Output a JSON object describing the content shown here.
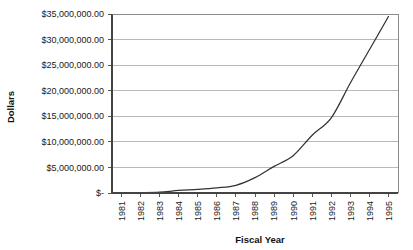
{
  "chart_data": {
    "type": "line",
    "title": "",
    "xlabel": "Fiscal Year",
    "ylabel": "Dollars",
    "grid": true,
    "legend": "none",
    "categories": [
      "1981",
      "1982",
      "1983",
      "1984",
      "1985",
      "1986",
      "1987",
      "1988",
      "1989",
      "1990",
      "1991",
      "1992",
      "1993",
      "1994",
      "1995"
    ],
    "x": [
      1981,
      1982,
      1983,
      1984,
      1985,
      1986,
      1987,
      1988,
      1989,
      1990,
      1991,
      1992,
      1993,
      1994,
      1995
    ],
    "series": [
      {
        "name": "Dollars",
        "values": [
          0,
          50000,
          150000,
          500000,
          700000,
          1000000,
          1500000,
          3000000,
          5200000,
          7300000,
          11300000,
          14700000,
          21500000,
          28000000,
          34500000
        ],
        "color": "#333333"
      }
    ],
    "ylim": [
      0,
      35000000
    ],
    "ytick_values": [
      0,
      5000000,
      10000000,
      15000000,
      20000000,
      25000000,
      30000000,
      35000000
    ],
    "ytick_labels": [
      "$-",
      "$5,000,000.00",
      "$10,000,000.00",
      "$15,000,000.00",
      "$20,000,000.00",
      "$25,000,000.00",
      "$30,000,000.00",
      "$35,000,000.00"
    ],
    "xtick_labels": [
      "1981",
      "1982",
      "1983",
      "1984",
      "1985",
      "1986",
      "1987",
      "1988",
      "1989",
      "1990",
      "1991",
      "1992",
      "1993",
      "1994",
      "1995"
    ],
    "xtick_rotation": -90,
    "colors": {
      "background": "#ffffff",
      "gridline": "#9a9a9a",
      "axis": "#444444",
      "text": "#1a1a1a",
      "series": "#333333"
    }
  }
}
